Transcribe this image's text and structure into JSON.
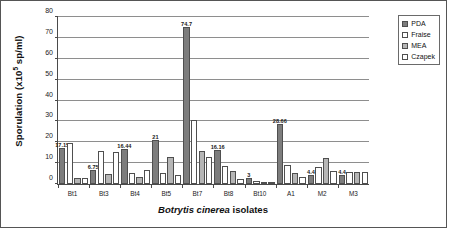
{
  "chart_data": {
    "type": "bar",
    "title": "",
    "xlabel": "Botrytis cinerea isolates",
    "xlabel_italic_part": "Botrytis cinerea",
    "xlabel_roman_part": "isolates",
    "ylabel": "Sporulation (x10",
    "ylabel_exponent": "5",
    "ylabel_tail": " sp/ml)",
    "ylim": [
      0,
      80
    ],
    "yticks": [
      0,
      10,
      20,
      30,
      40,
      50,
      60,
      70,
      80
    ],
    "ytick_labels": [
      "0",
      "10",
      "20",
      "30",
      "40",
      "50",
      "60",
      "70",
      "80"
    ],
    "grid": true,
    "grid_axis": "y",
    "legend_position": "top-right-outside",
    "categories": [
      "Bt1",
      "Bt3",
      "Bt4",
      "Bt5",
      "Bt7",
      "Bt8",
      "Bt10",
      "A1",
      "M2",
      "M3"
    ],
    "series": [
      {
        "name": "PDA",
        "color": "#7d7d7d",
        "values": [
          17.15,
          6.75,
          16.44,
          21.0,
          74.7,
          16.16,
          3.0,
          28.66,
          4.4,
          4.4
        ]
      },
      {
        "name": "Fraise",
        "color": "#ffffff",
        "values": [
          19.6,
          15.7,
          5.3,
          5.2,
          30.5,
          8.6,
          1.2,
          9.0,
          7.9,
          5.8
        ]
      },
      {
        "name": "MEA",
        "color": "#b6b6b6",
        "values": [
          3.0,
          4.8,
          3.3,
          13.1,
          15.5,
          6.0,
          0.6,
          5.2,
          12.6,
          5.7
        ]
      },
      {
        "name": "Czapek",
        "color": "#ffffff",
        "values": [
          3.0,
          15.3,
          6.9,
          4.3,
          13.0,
          2.6,
          0.4,
          3.3,
          6.3,
          5.7
        ]
      }
    ],
    "data_labels": [
      "17.15",
      "6.75",
      "16.44",
      "21",
      "74.7",
      "16.16",
      "3",
      "28.66",
      "4.4",
      "4.4"
    ],
    "data_label_series": "PDA"
  }
}
